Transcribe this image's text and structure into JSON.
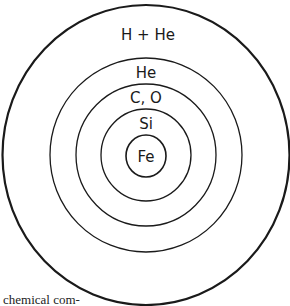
{
  "diagram": {
    "type": "concentric-shells",
    "layers": [
      {
        "label": "H + He",
        "cx": 146,
        "cy": 155,
        "rx": 144,
        "ry": 150,
        "stroke": 2.2
      },
      {
        "label": "He",
        "cx": 146,
        "cy": 155,
        "rx": 96,
        "ry": 97,
        "stroke": 1.3
      },
      {
        "label": "C, O",
        "cx": 146,
        "cy": 155,
        "rx": 70,
        "ry": 71,
        "stroke": 1.3
      },
      {
        "label": "Si",
        "cx": 146,
        "cy": 155,
        "rx": 45,
        "ry": 46,
        "stroke": 1.3
      },
      {
        "label": "Fe",
        "cx": 146,
        "cy": 156,
        "rx": 20,
        "ry": 21,
        "stroke": 1.6
      }
    ],
    "labels": {
      "outer": "H + He",
      "he": "He",
      "co": "C, O",
      "si": "Si",
      "fe": "Fe"
    },
    "stroke_color": "#1a1a1a",
    "caption_fragment": "e chemical com-"
  }
}
